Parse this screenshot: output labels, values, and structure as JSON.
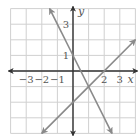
{
  "chart_data": {
    "type": "line",
    "title": "",
    "xlabel": "x",
    "ylabel": "y",
    "xlim": [
      -4,
      4
    ],
    "ylim": [
      -4,
      4
    ],
    "grid": true,
    "x_tick_labels": [
      "−3",
      "−2",
      "−1",
      "2",
      "3"
    ],
    "y_tick_labels": [
      "3",
      "1"
    ],
    "series": [
      {
        "name": "line1",
        "equation": "y = -2x + 1",
        "x": [
          -1.5,
          2.5
        ],
        "y": [
          4,
          -4
        ],
        "color": "#8a8a8a"
      },
      {
        "name": "line2",
        "equation": "y = x - 2",
        "x": [
          -2,
          4
        ],
        "y": [
          -4,
          2
        ],
        "color": "#8a8a8a"
      }
    ],
    "intersection": {
      "x": 1,
      "y": -1
    }
  },
  "colors": {
    "grid": "#d0d0d0",
    "axis": "#333333",
    "line": "#8a8a8a"
  }
}
